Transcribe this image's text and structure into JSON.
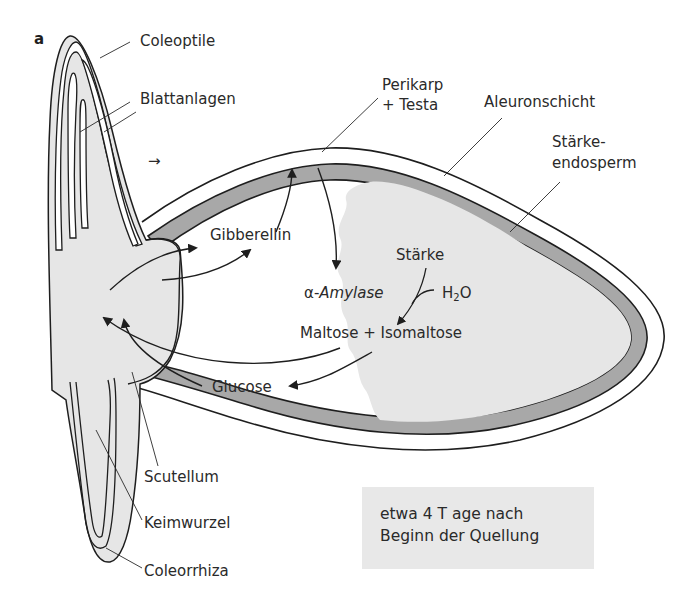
{
  "panel_letter": "a",
  "labels": {
    "coleoptile": "Coleoptile",
    "blattanlagen": "Blattanlagen",
    "perikarp_1": "Perikarp",
    "perikarp_2": "+ Testa",
    "aleuronschicht": "Aleuronschicht",
    "staerke_endo_1": "Stärke-",
    "staerke_endo_2": "endosperm",
    "gibberellin": "Gibberellin",
    "amylase_prefix": "α-",
    "amylase": "Amylase",
    "staerke": "Stärke",
    "h2o_h": "H",
    "h2o_sub": "2",
    "h2o_o": "O",
    "maltose": "Maltose + Isomaltose",
    "glucose": "Glucose",
    "scutellum": "Scutellum",
    "keimwurzel": "Keimwurzel",
    "coleorrhiza": "Coleorrhiza",
    "small_arrow": "→"
  },
  "note": {
    "line1": "etwa 4 T age nach",
    "line2": "Beginn der Quellung"
  },
  "colors": {
    "outline": "#1e1e1e",
    "tissue_fill": "#e6e6e6",
    "aleurone_fill": "#a8a8a8",
    "note_bg": "#e8e8e8"
  }
}
